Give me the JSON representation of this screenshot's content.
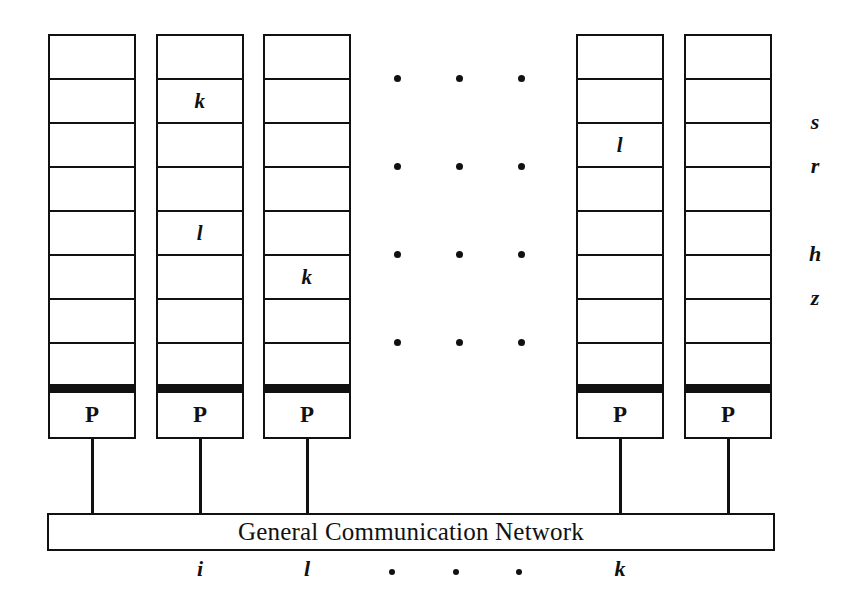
{
  "figure": {
    "background_color": "#ffffff",
    "ink_color": "#111111"
  },
  "network": {
    "label": "General Communication Network"
  },
  "processor_label": "P",
  "columns": [
    {
      "id": "column-1",
      "x": 48,
      "width": 88,
      "processor": "P",
      "cells": [
        "",
        "",
        "",
        "",
        "",
        "",
        "",
        ""
      ],
      "bottom_label": "",
      "stem_x": 92
    },
    {
      "id": "column-2",
      "x": 156,
      "width": 88,
      "processor": "P",
      "cells": [
        "",
        "k",
        "",
        "",
        "l",
        "",
        "",
        ""
      ],
      "bottom_label": "i",
      "stem_x": 200
    },
    {
      "id": "column-3",
      "x": 263,
      "width": 88,
      "processor": "P",
      "cells": [
        "",
        "",
        "",
        "",
        "",
        "k",
        "",
        ""
      ],
      "bottom_label": "l",
      "stem_x": 307
    },
    {
      "id": "column-4",
      "x": 576,
      "width": 88,
      "processor": "P",
      "cells": [
        "",
        "",
        "l",
        "",
        "",
        "",
        "",
        ""
      ],
      "bottom_label": "k",
      "stem_x": 620
    },
    {
      "id": "column-5",
      "x": 684,
      "width": 88,
      "processor": "P",
      "cells": [
        "",
        "",
        "",
        "",
        "",
        "",
        "",
        ""
      ],
      "bottom_label": "",
      "stem_x": 728
    }
  ],
  "row_labels": [
    {
      "text": "s",
      "row": 2
    },
    {
      "text": "r",
      "row": 3
    },
    {
      "text": "h",
      "row": 5
    },
    {
      "text": "z",
      "row": 6
    }
  ],
  "ellipsis_rows": [
    {
      "row": 1,
      "dots": 3
    },
    {
      "row": 3,
      "dots": 3
    },
    {
      "row": 5,
      "dots": 3
    },
    {
      "row": 7,
      "dots": 3
    }
  ],
  "bottom_axis": {
    "items": [
      "i",
      "l",
      "dot",
      "dot",
      "dot",
      "k"
    ]
  }
}
